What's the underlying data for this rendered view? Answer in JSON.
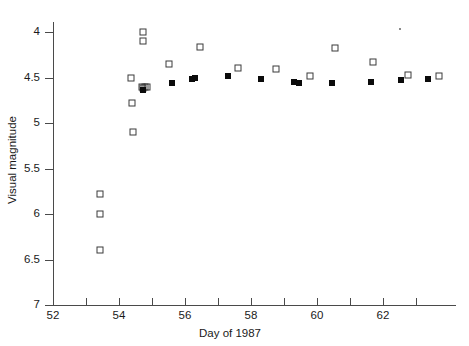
{
  "chart_data": {
    "type": "scatter",
    "title": "",
    "xlabel": "Day of 1987",
    "ylabel": "Visual magnitude",
    "xlim": [
      52,
      64.2
    ],
    "ylim": [
      7,
      3.75
    ],
    "y_inverted": true,
    "grid": false,
    "legend": "none",
    "xticks": [
      52,
      53,
      54,
      55,
      56,
      57,
      58,
      59,
      60,
      61,
      62,
      63
    ],
    "xtick_labels": [
      "52",
      "",
      "54",
      "",
      "56",
      "",
      "58",
      "",
      "60",
      "",
      "62",
      ""
    ],
    "yticks": [
      4,
      4.5,
      5,
      5.5,
      6,
      6.5,
      7
    ],
    "ytick_labels": [
      "4",
      "4.5",
      "5",
      "5.5",
      "6",
      "6.5",
      "7"
    ],
    "series": [
      {
        "name": "open-squares",
        "marker": "open square",
        "color": "#3a3a3a",
        "points": [
          [
            53.42,
            5.78
          ],
          [
            53.42,
            6.0
          ],
          [
            53.42,
            6.4
          ],
          [
            54.35,
            4.5
          ],
          [
            54.7,
            4.6
          ],
          [
            54.78,
            4.6
          ],
          [
            54.86,
            4.6
          ],
          [
            54.72,
            4.0
          ],
          [
            54.74,
            4.1
          ],
          [
            54.72,
            4.62
          ],
          [
            54.4,
            4.78
          ],
          [
            54.42,
            5.1
          ],
          [
            55.5,
            4.35
          ],
          [
            56.45,
            4.16
          ],
          [
            57.6,
            4.4
          ],
          [
            58.75,
            4.41
          ],
          [
            59.8,
            4.48
          ],
          [
            60.55,
            4.18
          ],
          [
            61.7,
            4.33
          ],
          [
            62.75,
            4.47
          ],
          [
            63.7,
            4.48
          ]
        ]
      },
      {
        "name": "filled-squares",
        "marker": "filled square",
        "color": "#0b0b0b",
        "points": [
          [
            54.72,
            4.64
          ],
          [
            55.6,
            4.56
          ],
          [
            56.2,
            4.52
          ],
          [
            56.3,
            4.5
          ],
          [
            57.3,
            4.48
          ],
          [
            58.3,
            4.52
          ],
          [
            59.3,
            4.55
          ],
          [
            59.45,
            4.56
          ],
          [
            60.45,
            4.56
          ],
          [
            61.65,
            4.55
          ],
          [
            62.55,
            4.53
          ],
          [
            63.35,
            4.52
          ]
        ]
      },
      {
        "name": "stray-point",
        "marker": "tiny dot",
        "color": "#8a8a8a",
        "points": [
          [
            62.5,
            3.97
          ]
        ]
      }
    ]
  },
  "axes": {
    "x_title": "Day of 1987",
    "y_title": "Visual magnitude"
  }
}
